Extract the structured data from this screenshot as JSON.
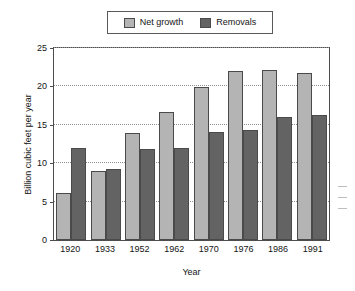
{
  "chart_data": {
    "type": "bar",
    "title": "",
    "xlabel": "Year",
    "ylabel": "Billion cubic feet per year",
    "categories": [
      "1920",
      "1933",
      "1952",
      "1962",
      "1970",
      "1976",
      "1986",
      "1991"
    ],
    "series": [
      {
        "name": "Net growth",
        "color": "#b4b4b4",
        "values": [
          6.1,
          9.0,
          13.9,
          16.7,
          19.9,
          22.0,
          22.2,
          21.7
        ]
      },
      {
        "name": "Removals",
        "color": "#636363",
        "values": [
          12.0,
          9.2,
          11.9,
          12.0,
          14.1,
          14.3,
          16.0,
          16.3
        ]
      }
    ],
    "ylim": [
      0,
      25
    ],
    "yticks": [
      0,
      5,
      10,
      15,
      20,
      25
    ],
    "ytick_labels": [
      "0",
      "5",
      "10",
      "15",
      "20",
      "25"
    ],
    "grid": true,
    "grid_axis": "y",
    "grid_style": "dotted",
    "legend_position": "top-center",
    "bar_border_color": "#4a4a4a",
    "frame_color": "#4d4d4d"
  },
  "legend": {
    "items": [
      {
        "label": "Net growth",
        "color": "#b4b4b4"
      },
      {
        "label": "Removals",
        "color": "#636363"
      }
    ]
  }
}
